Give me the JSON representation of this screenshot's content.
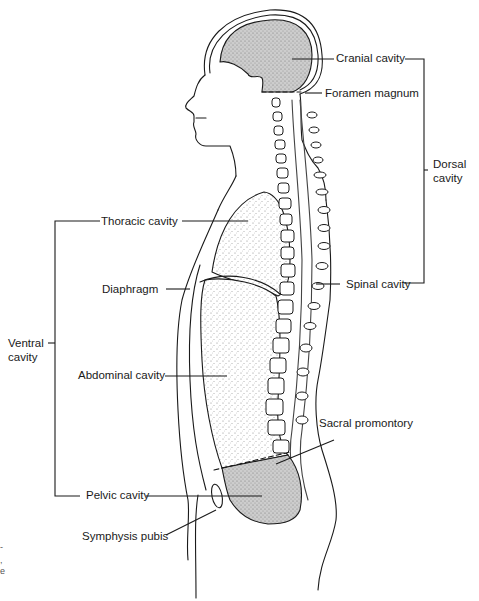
{
  "diagram": {
    "labels": {
      "cranial_cavity": "Cranial cavity",
      "foramen_magnum": "Foramen magnum",
      "dorsal_cavity_line1": "Dorsal",
      "dorsal_cavity_line2": "cavity",
      "thoracic_cavity": "Thoracic cavity",
      "diaphragm": "Diaphragm",
      "spinal_cavity": "Spinal cavity",
      "ventral_cavity_line1": "Ventral",
      "ventral_cavity_line2": "cavity",
      "abdominal_cavity": "Abdominal cavity",
      "sacral_promontory": "Sacral promontory",
      "pelvic_cavity": "Pelvic cavity",
      "symphysis_pubis": "Symphysis pubis"
    },
    "groups": {
      "dorsal": [
        "Cranial cavity",
        "Spinal cavity"
      ],
      "ventral": [
        "Thoracic cavity",
        "Abdominal cavity",
        "Pelvic cavity"
      ]
    },
    "edge_fragments": [
      "-",
      ",",
      "e"
    ],
    "colors": {
      "line": "#1a1a1a",
      "cavity_fill": "#cfcfcf",
      "stipple": "#9a9a9a",
      "background": "#ffffff"
    }
  }
}
